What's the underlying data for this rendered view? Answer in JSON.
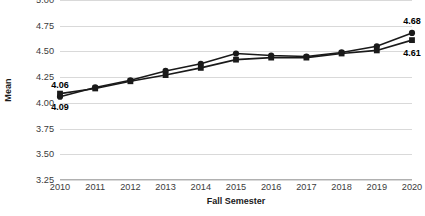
{
  "chart_data": {
    "type": "line",
    "title": "",
    "xlabel": "Fall Semester",
    "ylabel": "Mean",
    "categories": [
      "2010",
      "2011",
      "2012",
      "2013",
      "2014",
      "2015",
      "2016",
      "2017",
      "2018",
      "2019",
      "2020"
    ],
    "x": [
      2010,
      2011,
      2012,
      2013,
      2014,
      2015,
      2016,
      2017,
      2018,
      2019,
      2020
    ],
    "ylim": [
      3.25,
      5.0
    ],
    "yticks": [
      "3.25",
      "3.50",
      "3.75",
      "4.00",
      "4.25",
      "4.50",
      "4.75",
      "5.00"
    ],
    "ytick_values": [
      3.25,
      3.5,
      3.75,
      4.0,
      4.25,
      4.5,
      4.75,
      5.0
    ],
    "grid": true,
    "legend": "none",
    "series": [
      {
        "name": "series-circle",
        "marker": "circle",
        "color": "#1a1a1a",
        "values": [
          4.06,
          4.15,
          4.22,
          4.31,
          4.38,
          4.48,
          4.46,
          4.45,
          4.49,
          4.55,
          4.68
        ],
        "labels": [
          {
            "category": "2010",
            "value": 4.06,
            "text": "4.06",
            "position": "above"
          },
          {
            "category": "2020",
            "value": 4.68,
            "text": "4.68",
            "position": "above"
          }
        ]
      },
      {
        "name": "series-square",
        "marker": "square",
        "color": "#1a1a1a",
        "values": [
          4.09,
          4.14,
          4.21,
          4.27,
          4.34,
          4.42,
          4.44,
          4.44,
          4.48,
          4.51,
          4.61
        ],
        "labels": [
          {
            "category": "2010",
            "value": 4.09,
            "text": "4.09",
            "position": "below"
          },
          {
            "category": "2020",
            "value": 4.61,
            "text": "4.61",
            "position": "below"
          }
        ]
      }
    ]
  }
}
